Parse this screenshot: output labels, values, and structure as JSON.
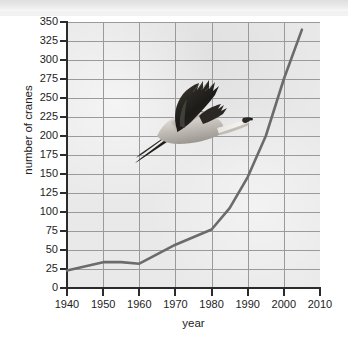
{
  "chart": {
    "type": "line",
    "title": "",
    "xlabel": "year",
    "ylabel": "number of cranes",
    "line_color": "#6b6b6b",
    "plot_background": "#e9e9e9",
    "grid_color": "#9a9a9a",
    "axis_color": "#2b2b2b",
    "grid": true,
    "legend": "none"
  },
  "axes": {
    "x": {
      "label": "year",
      "min": 1940,
      "max": 2010,
      "step": 10,
      "ticks": [
        "1940",
        "1950",
        "1960",
        "1970",
        "1980",
        "1990",
        "2000",
        "2010"
      ]
    },
    "y": {
      "label": "number of cranes",
      "min": 0,
      "max": 350,
      "step": 25,
      "ticks": [
        "350",
        "325",
        "300",
        "275",
        "250",
        "225",
        "200",
        "175",
        "150",
        "125",
        "100",
        "75",
        "50",
        "25",
        "0"
      ]
    }
  },
  "decoration": {
    "image_name": "whooping-crane-in-flight-photo",
    "description": "photograph of a crane in flight with wings raised, dark wingtips, long neck extended forward and legs trailing behind"
  },
  "chart_data": {
    "type": "line",
    "title": "",
    "xlabel": "year",
    "ylabel": "number of cranes",
    "xlim": [
      1940,
      2010
    ],
    "ylim": [
      0,
      350
    ],
    "grid": true,
    "legend_position": "none",
    "x": [
      1940,
      1950,
      1955,
      1960,
      1970,
      1980,
      1985,
      1990,
      1995,
      2000,
      2005
    ],
    "values": [
      23,
      34,
      34,
      32,
      57,
      77,
      105,
      146,
      200,
      275,
      340
    ],
    "series": [
      {
        "name": "number of cranes",
        "color": "#6b6b6b",
        "points": [
          {
            "x": 1940,
            "y": 23
          },
          {
            "x": 1950,
            "y": 34
          },
          {
            "x": 1955,
            "y": 34
          },
          {
            "x": 1960,
            "y": 32
          },
          {
            "x": 1970,
            "y": 57
          },
          {
            "x": 1980,
            "y": 77
          },
          {
            "x": 1985,
            "y": 105
          },
          {
            "x": 1990,
            "y": 146
          },
          {
            "x": 1995,
            "y": 200
          },
          {
            "x": 2000,
            "y": 275
          },
          {
            "x": 2005,
            "y": 340
          }
        ]
      }
    ]
  }
}
